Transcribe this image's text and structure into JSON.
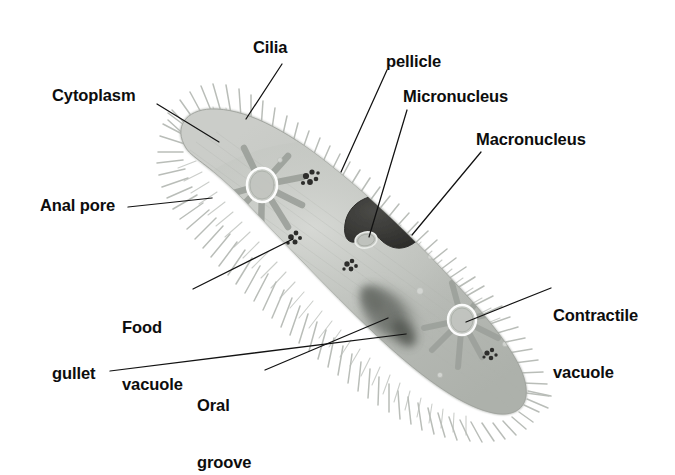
{
  "figure": {
    "background_color": "#ffffff",
    "ink_color": "#0d0d0d"
  },
  "colors": {
    "cytoplasm_light": "#cfd1cd",
    "cytoplasm_mid": "#bdc0bb",
    "cytoplasm_dark": "#a9ada7",
    "cilia": "#b9bcb7",
    "macronucleus": "#3a3a38",
    "oral_groove": "#7d817c",
    "food_speck": "#2b2b29",
    "leader_line": "#121212"
  },
  "labels": [
    {
      "id": "cilia",
      "text": "Cilia",
      "lines": [
        "Cilia"
      ]
    },
    {
      "id": "cytoplasm",
      "text": "Cytoplasm",
      "lines": [
        "Cytoplasm"
      ]
    },
    {
      "id": "pellicle",
      "text": "pellicle",
      "lines": [
        "pellicle"
      ]
    },
    {
      "id": "micronucleus",
      "text": "Micronucleus",
      "lines": [
        "Micronucleus"
      ]
    },
    {
      "id": "macronucleus",
      "text": "Macronucleus",
      "lines": [
        "Macronucleus"
      ]
    },
    {
      "id": "anal_pore",
      "text": "Anal pore",
      "lines": [
        "Anal pore"
      ]
    },
    {
      "id": "food_vacuole",
      "text": "Food vacuole",
      "lines": [
        "Food",
        "vacuole"
      ]
    },
    {
      "id": "gullet",
      "text": "gullet",
      "lines": [
        "gullet"
      ]
    },
    {
      "id": "oral_groove",
      "text": "Oral groove",
      "lines": [
        "Oral",
        "groove"
      ]
    },
    {
      "id": "contractile_vacuole",
      "text": "Contractile vacuole",
      "lines": [
        "Contractile",
        "vacuole"
      ]
    }
  ],
  "label_text": {
    "cilia": "Cilia",
    "cytoplasm": "Cytoplasm",
    "pellicle": "pellicle",
    "micronucleus": "Micronucleus",
    "macronucleus": "Macronucleus",
    "anal_pore": "Anal pore",
    "food_vacuole_l1": "Food",
    "food_vacuole_l2": "vacuole",
    "gullet": "gullet",
    "oral_groove_l1": "Oral",
    "oral_groove_l2": "groove",
    "contractile_l1": "Contractile",
    "contractile_l2": "vacuole"
  },
  "structures": [
    {
      "name": "cell-body",
      "note": "elongated slipper-shaped cell, diagonal upper-left to lower-right"
    },
    {
      "name": "cilia-fringe",
      "note": "hair-like projections around entire cell margin"
    },
    {
      "name": "macronucleus",
      "note": "large dark kidney-bean shaped body near cell center"
    },
    {
      "name": "micronucleus",
      "note": "small pale oval tucked into concave side of macronucleus"
    },
    {
      "name": "contractile-vacuole-anterior",
      "note": "star with radiating canals, upper-left region"
    },
    {
      "name": "contractile-vacuole-posterior",
      "note": "star with radiating canals, lower-right region"
    },
    {
      "name": "oral-groove",
      "note": "dark diffuse funnel on lower margin leading inward"
    },
    {
      "name": "gullet",
      "note": "deep end of oral groove"
    },
    {
      "name": "anal-pore",
      "note": "dark speck at left margin of cell"
    },
    {
      "name": "food-vacuoles",
      "note": "scattered dark granular clusters in cytoplasm"
    },
    {
      "name": "pellicle",
      "note": "outer membrane layer at cell surface"
    }
  ]
}
